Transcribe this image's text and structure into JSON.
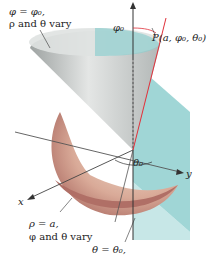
{
  "labels": {
    "cone_eq": "φ = φ₀,",
    "cone_vary": "ρ and θ vary",
    "phi0": "φ₀",
    "point": "P(a, φ₀, θ₀)",
    "theta0": "θ₀",
    "y_axis": "y",
    "x_axis": "x",
    "sphere_eq": "ρ = a,",
    "sphere_vary": "φ and θ vary",
    "plane_eq": "θ = θ₀,"
  },
  "colors": {
    "cone": "#c9cdcc",
    "cone_dark": "#9ea3a2",
    "plane": "#8fcfcf",
    "sphere": "#b9776f",
    "sphere_light": "#e7c7b2",
    "ray": "#e0303a",
    "axis": "#333333"
  }
}
